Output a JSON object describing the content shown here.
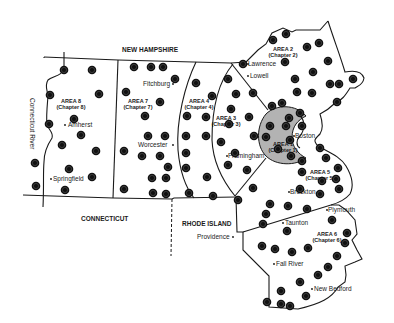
{
  "map": {
    "title": "Massachusetts Chapter Areas",
    "states": [
      {
        "id": "nh",
        "label": "NEW HAMPSHIRE",
        "x": 122,
        "y": 52
      },
      {
        "id": "ct",
        "label": "CONNECTICUT",
        "x": 81,
        "y": 221
      },
      {
        "id": "ri",
        "label": "RHODE ISLAND",
        "x": 182,
        "y": 226
      }
    ],
    "river": {
      "label": "Connecticut River"
    },
    "areas": [
      {
        "id": "area1",
        "line1": "AREA 1",
        "line2": "(Chapter 1)",
        "x": 283,
        "y": 146
      },
      {
        "id": "area2",
        "line1": "AREA 2",
        "line2": "(Chapter 2)",
        "x": 283,
        "y": 51
      },
      {
        "id": "area3",
        "line1": "AREA 3",
        "line2": "(Chapter 3)",
        "x": 226,
        "y": 120
      },
      {
        "id": "area4",
        "line1": "AREA 4",
        "line2": "(Chapter 4)",
        "x": 199,
        "y": 103
      },
      {
        "id": "area5",
        "line1": "AREA 5",
        "line2": "(Chapter 5)",
        "x": 320,
        "y": 174
      },
      {
        "id": "area6",
        "line1": "AREA 6",
        "line2": "(Chapter 6)",
        "x": 327,
        "y": 236
      },
      {
        "id": "area7",
        "line1": "AREA 7",
        "line2": "(Chapter 7)",
        "x": 138,
        "y": 103
      },
      {
        "id": "area8",
        "line1": "AREA 8",
        "line2": "(Chapter 8)",
        "x": 71,
        "y": 103
      }
    ],
    "cities": [
      {
        "name": "Fitchburg",
        "x": 143,
        "y": 86,
        "dx": 30
      },
      {
        "name": "Amherst",
        "x": 68,
        "y": 127,
        "dx": -5
      },
      {
        "name": "Worcester",
        "x": 138,
        "y": 147,
        "dx": 35
      },
      {
        "name": "Springfield",
        "x": 53,
        "y": 181,
        "dx": -4
      },
      {
        "name": "Lawrence",
        "x": 248,
        "y": 66,
        "dx": -2
      },
      {
        "name": "Lowell",
        "x": 250,
        "y": 78,
        "dx": -4
      },
      {
        "name": "Boston",
        "x": 295,
        "y": 138,
        "dx": -3
      },
      {
        "name": "Framingham",
        "x": 228,
        "y": 158,
        "dx": -3
      },
      {
        "name": "Brockton",
        "x": 290,
        "y": 194,
        "dx": -3
      },
      {
        "name": "Plymouth",
        "x": 328,
        "y": 212,
        "dx": -3
      },
      {
        "name": "Taunton",
        "x": 285,
        "y": 225,
        "dx": -4
      },
      {
        "name": "Providence",
        "x": 197,
        "y": 239,
        "dx": 36
      },
      {
        "name": "Fall River",
        "x": 276,
        "y": 266,
        "dx": -4
      },
      {
        "name": "New Bedford",
        "x": 314,
        "y": 291,
        "dx": -4
      }
    ],
    "chapter_markers": [
      [
        64,
        70
      ],
      [
        92,
        70
      ],
      [
        99,
        94
      ],
      [
        50,
        95
      ],
      [
        74,
        119
      ],
      [
        49,
        124
      ],
      [
        81,
        135
      ],
      [
        62,
        145
      ],
      [
        96,
        151
      ],
      [
        35,
        163
      ],
      [
        69,
        169
      ],
      [
        92,
        177
      ],
      [
        36,
        186
      ],
      [
        65,
        190
      ],
      [
        134,
        67
      ],
      [
        151,
        67
      ],
      [
        163,
        67
      ],
      [
        175,
        79
      ],
      [
        126,
        92
      ],
      [
        160,
        102
      ],
      [
        145,
        116
      ],
      [
        148,
        136
      ],
      [
        165,
        136
      ],
      [
        124,
        151
      ],
      [
        142,
        156
      ],
      [
        160,
        156
      ],
      [
        168,
        167
      ],
      [
        166,
        178
      ],
      [
        152,
        178
      ],
      [
        166,
        194
      ],
      [
        124,
        189
      ],
      [
        153,
        193
      ],
      [
        196,
        83
      ],
      [
        212,
        96
      ],
      [
        187,
        116
      ],
      [
        206,
        117
      ],
      [
        186,
        136
      ],
      [
        206,
        136
      ],
      [
        186,
        153
      ],
      [
        186,
        168
      ],
      [
        207,
        177
      ],
      [
        189,
        193
      ],
      [
        213,
        196
      ],
      [
        228,
        165
      ],
      [
        228,
        79
      ],
      [
        236,
        94
      ],
      [
        231,
        109
      ],
      [
        253,
        93
      ],
      [
        229,
        124
      ],
      [
        249,
        117
      ],
      [
        254,
        136
      ],
      [
        221,
        142
      ],
      [
        235,
        153
      ],
      [
        247,
        170
      ],
      [
        253,
        188
      ],
      [
        238,
        200
      ],
      [
        243,
        64
      ],
      [
        273,
        40
      ],
      [
        286,
        34
      ],
      [
        307,
        47
      ],
      [
        319,
        43
      ],
      [
        285,
        62
      ],
      [
        328,
        61
      ],
      [
        313,
        72
      ],
      [
        295,
        79
      ],
      [
        330,
        84
      ],
      [
        339,
        84
      ],
      [
        353,
        79
      ],
      [
        312,
        93
      ],
      [
        297,
        92
      ],
      [
        337,
        102
      ],
      [
        272,
        106
      ],
      [
        282,
        103
      ],
      [
        289,
        118
      ],
      [
        300,
        113
      ],
      [
        286,
        126
      ],
      [
        270,
        126
      ],
      [
        302,
        126
      ],
      [
        290,
        140
      ],
      [
        278,
        149
      ],
      [
        266,
        137
      ],
      [
        291,
        156
      ],
      [
        302,
        161
      ],
      [
        320,
        148
      ],
      [
        326,
        158
      ],
      [
        338,
        168
      ],
      [
        302,
        172
      ],
      [
        322,
        181
      ],
      [
        336,
        179
      ],
      [
        339,
        189
      ],
      [
        300,
        189
      ],
      [
        320,
        194
      ],
      [
        288,
        206
      ],
      [
        270,
        204
      ],
      [
        266,
        214
      ],
      [
        263,
        224
      ],
      [
        287,
        231
      ],
      [
        307,
        209
      ],
      [
        332,
        220
      ],
      [
        347,
        233
      ],
      [
        345,
        243
      ],
      [
        337,
        256
      ],
      [
        328,
        267
      ],
      [
        308,
        248
      ],
      [
        262,
        246
      ],
      [
        275,
        249
      ],
      [
        292,
        252
      ],
      [
        318,
        275
      ],
      [
        300,
        282
      ],
      [
        306,
        296
      ],
      [
        281,
        304
      ],
      [
        290,
        306
      ],
      [
        267,
        302
      ],
      [
        281,
        291
      ]
    ]
  }
}
